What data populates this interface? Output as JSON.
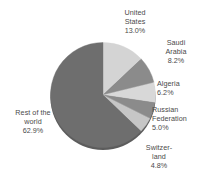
{
  "chart_data": {
    "type": "pie",
    "title": "",
    "subtitle": "",
    "xlabel": "",
    "ylabel": "",
    "legend_position": "none",
    "grid": false,
    "units": "percent",
    "start_angle_deg": 0,
    "direction": "clockwise",
    "categories": [
      "United States",
      "Saudi Arabia",
      "Algeria",
      "Russian Federation",
      "Switzerland",
      "Rest of the world"
    ],
    "values": [
      13.0,
      8.2,
      6.2,
      5.0,
      4.8,
      62.9
    ],
    "slices": [
      {
        "name": "united-states",
        "label_lines": [
          "United",
          "States"
        ],
        "value_label": "13.0%",
        "value": 13.0,
        "color": "#d4d4d4"
      },
      {
        "name": "saudi-arabia",
        "label_lines": [
          "Saudi",
          "Arabia"
        ],
        "value_label": "8.2%",
        "value": 8.2,
        "color": "#8b8b8b"
      },
      {
        "name": "algeria",
        "label_lines": [
          "Algeria"
        ],
        "value_label": "6.2%",
        "value": 6.2,
        "color": "#d8d8d8"
      },
      {
        "name": "russian-federation",
        "label_lines": [
          "Russian",
          "Federation"
        ],
        "value_label": "5.0%",
        "value": 5.0,
        "color": "#8b8b8b"
      },
      {
        "name": "switzerland",
        "label_lines": [
          "Switzer-",
          "land"
        ],
        "value_label": "4.8%",
        "value": 4.8,
        "color": "#c6c6c6"
      },
      {
        "name": "rest-of-the-world",
        "label_lines": [
          "Rest of the",
          "world"
        ],
        "value_label": "62.9%",
        "value": 62.9,
        "color": "#6e6e6e"
      }
    ]
  },
  "colors": {
    "background": "#ffffff",
    "text": "#4a4a4a",
    "shadow": "#5a5a5a",
    "light_slice": "#d4d4d4",
    "mid_slice": "#8b8b8b",
    "dark_slice": "#6e6e6e"
  }
}
